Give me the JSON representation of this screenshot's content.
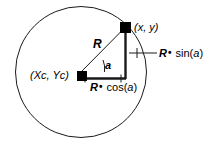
{
  "figure": {
    "type": "geometry-diagram",
    "background_color": "#ffffff",
    "stroke_color": "#000000",
    "marker_color": "#000000"
  },
  "labels": {
    "point_on_circle": "(x, y)",
    "center": "(Xc, Yc)",
    "radius": "R",
    "angle": "a",
    "horizontal_component": {
      "var": "R",
      "dot": "•",
      "fn": "cos",
      "open": "(",
      "arg": "a",
      "close": ")",
      "full": "R• cos(a)"
    },
    "vertical_component": {
      "var": "R",
      "dot": "•",
      "fn": "sin",
      "open": "(",
      "arg": "a",
      "close": ")",
      "full": "R• sin(a)"
    }
  },
  "geometry": {
    "circle": {
      "cx": 81,
      "cy": 72,
      "r": 65.5
    },
    "center_marker": {
      "x": 77,
      "y": 72,
      "size": 10
    },
    "point_marker": {
      "x": 125,
      "y": 27,
      "size": 11
    },
    "radius_line": {
      "x1": 81,
      "y1": 72,
      "x2": 125,
      "y2": 27
    },
    "vertical_line": {
      "x1": 125,
      "y1": 27,
      "x2": 125,
      "y2": 78
    },
    "horizontal_line": {
      "x1": 81,
      "y1": 78,
      "x2": 125,
      "y2": 78
    },
    "angle_arc_radius": 22,
    "sin_leader": {
      "x1": 128,
      "y1": 53,
      "x2": 158,
      "y2": 53
    },
    "sin_tick": {
      "x": 138,
      "y1": 48,
      "y2": 58
    }
  }
}
